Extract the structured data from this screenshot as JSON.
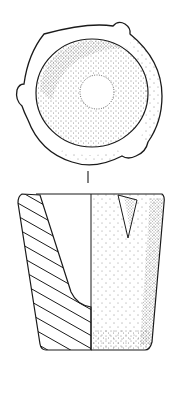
{
  "figure": {
    "kind": "archaeological line drawing",
    "views": [
      {
        "id": "plan",
        "label": "plan view from above, circular rim with three lugs, stippled interior bowl"
      },
      {
        "id": "section",
        "label": "profile: left half hatched cross-section, right half stippled exterior"
      }
    ],
    "colors": {
      "ink": "#1a1a1a",
      "paper": "#ffffff"
    }
  }
}
